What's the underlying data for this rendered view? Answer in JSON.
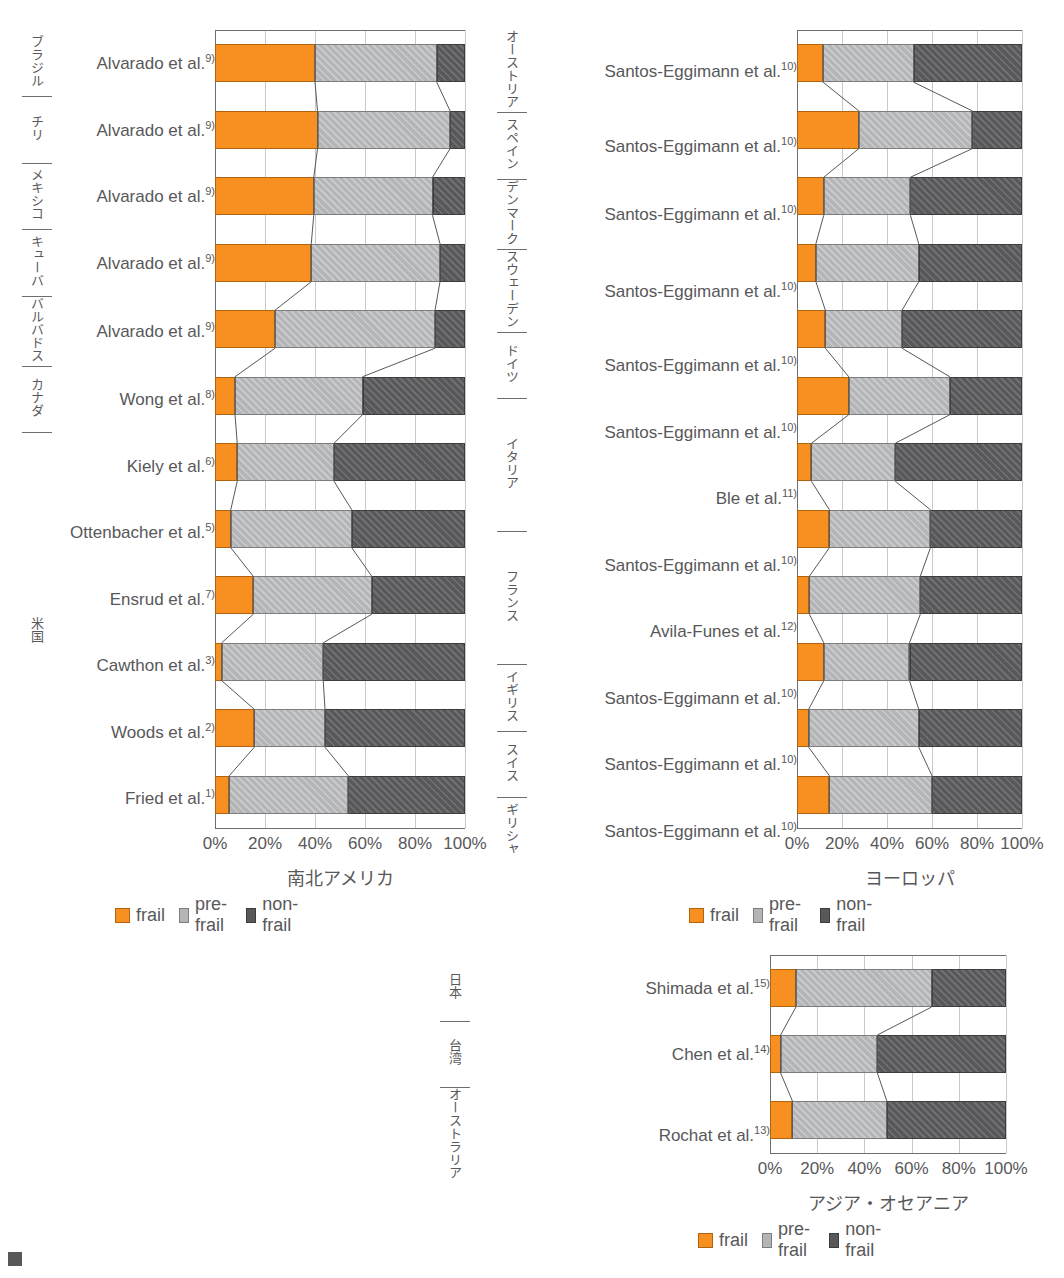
{
  "figure": {
    "legend_labels": [
      "frail",
      "pre-frail",
      "non-frail"
    ],
    "colors": {
      "frail": "#f79020",
      "pre_frail": "#b4b5b7",
      "non_frail": "#58585a"
    },
    "axis_ticks": [
      "0%",
      "20%",
      "40%",
      "60%",
      "80%",
      "100%"
    ]
  },
  "chart_data": [
    {
      "type": "bar",
      "orientation": "horizontal",
      "stacked": true,
      "percent": true,
      "title": "南北アメリカ",
      "xlabel": "",
      "ylabel": "",
      "xlim": [
        0,
        100
      ],
      "xticks": [
        0,
        20,
        40,
        60,
        80,
        100
      ],
      "xtick_labels": [
        "0%",
        "20%",
        "40%",
        "60%",
        "80%",
        "100%"
      ],
      "grid": "vertical",
      "legend": [
        "frail",
        "pre-frail",
        "non-frail"
      ],
      "legend_position": "below",
      "categories": [
        "Alvarado et al.9)",
        "Alvarado et al.9)",
        "Alvarado et al.9)",
        "Alvarado et al.9)",
        "Alvarado et al.9)",
        "Wong et al.8)",
        "Kiely et al.6)",
        "Ottenbacher et al.5)",
        "Ensrud et al.7)",
        "Cawthon et al.3)",
        "Woods et al.2)",
        "Fried et al.1)"
      ],
      "groups": [
        {
          "label": "ブラジル",
          "rows": 1
        },
        {
          "label": "チリ",
          "rows": 1
        },
        {
          "label": "メキシコ",
          "rows": 1
        },
        {
          "label": "キューバ",
          "rows": 1
        },
        {
          "label": "バルバドス",
          "rows": 1
        },
        {
          "label": "カナダ",
          "rows": 1
        },
        {
          "label": "米国",
          "rows": 6
        }
      ],
      "series": [
        {
          "name": "frail",
          "values": [
            40.0,
            41.0,
            39.5,
            38.5,
            24.0,
            8.0,
            8.9,
            6.3,
            15.3,
            2.7,
            15.7,
            5.7
          ]
        },
        {
          "name": "pre-frail",
          "values": [
            48.7,
            53.0,
            47.5,
            51.5,
            64.0,
            51.0,
            38.7,
            48.4,
            47.4,
            40.6,
            28.3,
            47.6
          ]
        },
        {
          "name": "non-frail",
          "values": [
            11.3,
            6.0,
            13.0,
            10.0,
            12.0,
            41.0,
            52.4,
            45.3,
            37.3,
            56.7,
            56.0,
            46.7
          ]
        }
      ]
    },
    {
      "type": "bar",
      "orientation": "horizontal",
      "stacked": true,
      "percent": true,
      "title": "ヨーロッパ",
      "xlabel": "",
      "ylabel": "",
      "xlim": [
        0,
        100
      ],
      "xticks": [
        0,
        20,
        40,
        60,
        80,
        100
      ],
      "xtick_labels": [
        "0%",
        "20%",
        "40%",
        "60%",
        "80%",
        "100%"
      ],
      "grid": "vertical",
      "legend": [
        "frail",
        "pre-frail",
        "non-frail"
      ],
      "legend_position": "below",
      "categories": [
        "Santos-Eggimann et al.10)",
        "Santos-Eggimann et al.10)",
        "Santos-Eggimann et al.10)",
        "Santos-Eggimann et al.10)",
        "Santos-Eggimann et al.10)",
        "Santos-Eggimann et al.10)",
        "Ble et al.11)",
        "Santos-Eggimann et al.10)",
        "Avila-Funes et al.12)",
        "Santos-Eggimann et al.10)",
        "Santos-Eggimann et al.10)",
        "Santos-Eggimann et al.10)"
      ],
      "groups": [
        {
          "label": "オーストリア",
          "rows": 1
        },
        {
          "label": "スペイン",
          "rows": 1
        },
        {
          "label": "デンマーク",
          "rows": 1
        },
        {
          "label": "スウェーデン",
          "rows": 1
        },
        {
          "label": "ドイツ",
          "rows": 1
        },
        {
          "label": "イタリア",
          "rows": 2
        },
        {
          "label": "フランス",
          "rows": 2
        },
        {
          "label": "イギリス",
          "rows": 1
        },
        {
          "label": "スイス",
          "rows": 1
        },
        {
          "label": "ギリシャ",
          "rows": 1
        }
      ],
      "series": [
        {
          "name": "frail",
          "values": [
            11.6,
            27.4,
            11.9,
            8.4,
            12.6,
            23.0,
            6.4,
            14.4,
            5.5,
            11.9,
            5.2,
            14.4
          ]
        },
        {
          "name": "pre-frail",
          "values": [
            40.3,
            50.4,
            38.5,
            45.7,
            34.1,
            44.9,
            37.3,
            44.9,
            49.3,
            38.1,
            48.9,
            45.6
          ]
        },
        {
          "name": "non-frail",
          "values": [
            48.1,
            22.2,
            49.6,
            45.9,
            53.3,
            32.1,
            56.3,
            40.7,
            45.2,
            50.0,
            45.9,
            40.0
          ]
        }
      ]
    },
    {
      "type": "bar",
      "orientation": "horizontal",
      "stacked": true,
      "percent": true,
      "title": "アジア・オセアニア",
      "xlabel": "",
      "ylabel": "",
      "xlim": [
        0,
        100
      ],
      "xticks": [
        0,
        20,
        40,
        60,
        80,
        100
      ],
      "xtick_labels": [
        "0%",
        "20%",
        "40%",
        "60%",
        "80%",
        "100%"
      ],
      "grid": "vertical",
      "legend": [
        "frail",
        "pre-frail",
        "non-frail"
      ],
      "legend_position": "below",
      "categories": [
        "Shimada et al.15)",
        "Chen et al.14)",
        "Rochat et al.13)"
      ],
      "groups": [
        {
          "label": "日本",
          "rows": 1
        },
        {
          "label": "台湾",
          "rows": 1
        },
        {
          "label": "オーストラリア",
          "rows": 1
        }
      ],
      "series": [
        {
          "name": "frail",
          "values": [
            11.0,
            4.5,
            9.5
          ]
        },
        {
          "name": "pre-frail",
          "values": [
            57.5,
            41.0,
            40.0
          ]
        },
        {
          "name": "non-frail",
          "values": [
            31.5,
            54.5,
            50.5
          ]
        }
      ]
    }
  ],
  "charts": [
    {
      "id": "americas",
      "title": "南北アメリカ",
      "ticks": [
        "0%",
        "20%",
        "40%",
        "60%",
        "80%",
        "100%"
      ],
      "legend": [
        "frail",
        "pre-frail",
        "non-frail"
      ],
      "groups": [
        {
          "country": "ブラジル",
          "studies": [
            {
              "name": "Alvarado et al.",
              "ref": "9)",
              "frail": 40.0,
              "prefrail": 48.7,
              "nonfrail": 11.3
            }
          ]
        },
        {
          "country": "チリ",
          "studies": [
            {
              "name": "Alvarado et al.",
              "ref": "9)",
              "frail": 41.0,
              "prefrail": 53.0,
              "nonfrail": 6.0
            }
          ]
        },
        {
          "country": "メキシコ",
          "studies": [
            {
              "name": "Alvarado et al.",
              "ref": "9)",
              "frail": 39.5,
              "prefrail": 47.5,
              "nonfrail": 13.0
            }
          ]
        },
        {
          "country": "キューバ",
          "studies": [
            {
              "name": "Alvarado et al.",
              "ref": "9)",
              "frail": 38.5,
              "prefrail": 51.5,
              "nonfrail": 10.0
            }
          ]
        },
        {
          "country": "バルバドス",
          "studies": [
            {
              "name": "Alvarado et al.",
              "ref": "9)",
              "frail": 24.0,
              "prefrail": 64.0,
              "nonfrail": 12.0
            }
          ]
        },
        {
          "country": "カナダ",
          "studies": [
            {
              "name": "Wong et al.",
              "ref": "8)",
              "frail": 8.0,
              "prefrail": 51.0,
              "nonfrail": 41.0
            }
          ]
        },
        {
          "country": "米国",
          "studies": [
            {
              "name": "Kiely et al.",
              "ref": "6)",
              "frail": 8.9,
              "prefrail": 38.7,
              "nonfrail": 52.4
            },
            {
              "name": "Ottenbacher et al.",
              "ref": "5)",
              "frail": 6.3,
              "prefrail": 48.4,
              "nonfrail": 45.3
            },
            {
              "name": "Ensrud et al.",
              "ref": "7)",
              "frail": 15.3,
              "prefrail": 47.4,
              "nonfrail": 37.3
            },
            {
              "name": "Cawthon et al.",
              "ref": "3)",
              "frail": 2.7,
              "prefrail": 40.6,
              "nonfrail": 56.7
            },
            {
              "name": "Woods et al.",
              "ref": "2)",
              "frail": 15.7,
              "prefrail": 28.3,
              "nonfrail": 56.0
            },
            {
              "name": "Fried et al.",
              "ref": "1)",
              "frail": 5.7,
              "prefrail": 47.6,
              "nonfrail": 46.7
            }
          ]
        }
      ]
    },
    {
      "id": "europe",
      "title": "ヨーロッパ",
      "ticks": [
        "0%",
        "20%",
        "40%",
        "60%",
        "80%",
        "100%"
      ],
      "legend": [
        "frail",
        "pre-frail",
        "non-frail"
      ],
      "groups": [
        {
          "country": "オーストリア",
          "studies": [
            {
              "name": "Santos-Eggimann et al.",
              "ref": "10)",
              "frail": 11.6,
              "prefrail": 40.3,
              "nonfrail": 48.1
            }
          ]
        },
        {
          "country": "スペイン",
          "studies": [
            {
              "name": "Santos-Eggimann et al.",
              "ref": "10)",
              "frail": 27.4,
              "prefrail": 50.4,
              "nonfrail": 22.2
            }
          ]
        },
        {
          "country": "デンマーク",
          "studies": [
            {
              "name": "Santos-Eggimann et al.",
              "ref": "10)",
              "frail": 11.9,
              "prefrail": 38.5,
              "nonfrail": 49.6
            }
          ]
        },
        {
          "country": "スウェーデン",
          "studies": [
            {
              "name": "Santos-Eggimann et al.",
              "ref": "10)",
              "frail": 8.4,
              "prefrail": 45.7,
              "nonfrail": 45.9
            }
          ]
        },
        {
          "country": "ドイツ",
          "studies": [
            {
              "name": "Santos-Eggimann et al.",
              "ref": "10)",
              "frail": 12.6,
              "prefrail": 34.1,
              "nonfrail": 53.3
            }
          ]
        },
        {
          "country": "イタリア",
          "studies": [
            {
              "name": "Santos-Eggimann et al.",
              "ref": "10)",
              "frail": 23.0,
              "prefrail": 44.9,
              "nonfrail": 32.1
            },
            {
              "name": "Ble et al.",
              "ref": "11)",
              "frail": 6.4,
              "prefrail": 37.3,
              "nonfrail": 56.3
            }
          ]
        },
        {
          "country": "フランス",
          "studies": [
            {
              "name": "Santos-Eggimann et al.",
              "ref": "10)",
              "frail": 14.4,
              "prefrail": 44.9,
              "nonfrail": 40.7
            },
            {
              "name": "Avila-Funes et al.",
              "ref": "12)",
              "frail": 5.5,
              "prefrail": 49.3,
              "nonfrail": 45.2
            }
          ]
        },
        {
          "country": "イギリス",
          "studies": [
            {
              "name": "Santos-Eggimann et al.",
              "ref": "10)",
              "frail": 11.9,
              "prefrail": 38.1,
              "nonfrail": 50.0
            }
          ]
        },
        {
          "country": "スイス",
          "studies": [
            {
              "name": "Santos-Eggimann et al.",
              "ref": "10)",
              "frail": 5.2,
              "prefrail": 48.9,
              "nonfrail": 45.9
            }
          ]
        },
        {
          "country": "ギリシャ",
          "studies": [
            {
              "name": "Santos-Eggimann et al.",
              "ref": "10)",
              "frail": 14.4,
              "prefrail": 45.6,
              "nonfrail": 40.0
            }
          ]
        }
      ]
    },
    {
      "id": "asia",
      "title": "アジア・オセアニア",
      "ticks": [
        "0%",
        "20%",
        "40%",
        "60%",
        "80%",
        "100%"
      ],
      "legend": [
        "frail",
        "pre-frail",
        "non-frail"
      ],
      "groups": [
        {
          "country": "日本",
          "studies": [
            {
              "name": "Shimada et al.",
              "ref": "15)",
              "frail": 11.0,
              "prefrail": 57.5,
              "nonfrail": 31.5
            }
          ]
        },
        {
          "country": "台湾",
          "studies": [
            {
              "name": "Chen et al.",
              "ref": "14)",
              "frail": 4.5,
              "prefrail": 41.0,
              "nonfrail": 54.5
            }
          ]
        },
        {
          "country": "オーストラリア",
          "studies": [
            {
              "name": "Rochat et al.",
              "ref": "13)",
              "frail": 9.5,
              "prefrail": 40.0,
              "nonfrail": 50.5
            }
          ]
        }
      ]
    }
  ]
}
